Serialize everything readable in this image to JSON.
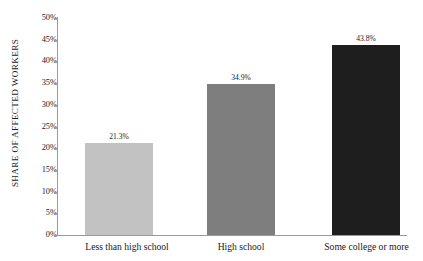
{
  "chart_data": {
    "type": "bar",
    "title": "",
    "subtitle": "",
    "xlabel": "",
    "ylabel": "SHARE OF AFFECTED WORKERS",
    "categories": [
      "Less than high school",
      "High school",
      "Some college or more"
    ],
    "values": [
      21.3,
      34.9,
      43.8
    ],
    "value_labels": [
      "21.3%",
      "34.9%",
      "43.8%"
    ],
    "series": [
      {
        "name": "Share of affected workers",
        "values": [
          21.3,
          34.9,
          43.8
        ]
      }
    ],
    "bar_colors": [
      "#c2c2c2",
      "#7e7e7e",
      "#1e1e1e"
    ],
    "ylim": [
      0,
      50
    ],
    "ytick_values": [
      0,
      5,
      10,
      15,
      20,
      25,
      30,
      35,
      40,
      45,
      50
    ],
    "ytick_labels": [
      "0%",
      "5%",
      "10%",
      "15%",
      "20%",
      "25%",
      "30%",
      "35%",
      "40%",
      "45%",
      "50%"
    ],
    "grid": false,
    "legend": false,
    "legend_position": "none",
    "axis_color": "#9a9a9a",
    "text_color": "#1a1a1a",
    "background": "#ffffff"
  }
}
